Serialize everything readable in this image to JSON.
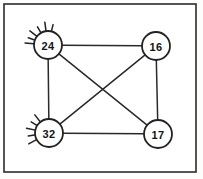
{
  "figure": {
    "background_color": "#fdfdfc",
    "ink_color": "#222222",
    "frame": {
      "name": "border frame",
      "x": 4,
      "y": 4,
      "width": 192,
      "height": 168
    }
  },
  "nodes": [
    {
      "id": "n24",
      "label": "24",
      "cx": 48,
      "cy": 45,
      "r": 14,
      "has_spikes": true,
      "spike_angles": [
        185,
        200,
        218,
        240,
        262,
        284
      ]
    },
    {
      "id": "n16",
      "label": "16",
      "cx": 156,
      "cy": 46,
      "r": 14,
      "has_spikes": false,
      "spike_angles": []
    },
    {
      "id": "n32",
      "label": "32",
      "cx": 49,
      "cy": 133,
      "r": 14,
      "has_spikes": true,
      "spike_angles": [
        152,
        172,
        192,
        212,
        232
      ]
    },
    {
      "id": "n17",
      "label": "17",
      "cx": 158,
      "cy": 134,
      "r": 14,
      "has_spikes": false,
      "spike_angles": []
    }
  ],
  "edges": [
    {
      "id": "e-24-16",
      "from": "n24",
      "to": "n16",
      "name": "edge-24-16"
    },
    {
      "id": "e-24-32",
      "from": "n24",
      "to": "n32",
      "name": "edge-24-32"
    },
    {
      "id": "e-16-17",
      "from": "n16",
      "to": "n17",
      "name": "edge-16-17"
    },
    {
      "id": "e-32-17",
      "from": "n32",
      "to": "n17",
      "name": "edge-32-17"
    },
    {
      "id": "e-24-17",
      "from": "n24",
      "to": "n17",
      "name": "edge-24-17"
    },
    {
      "id": "e-32-16",
      "from": "n32",
      "to": "n16",
      "name": "edge-32-16"
    }
  ],
  "chart_data": {
    "type": "diagram",
    "node_labels": [
      "24",
      "16",
      "32",
      "17"
    ],
    "node_values": [
      24,
      16,
      32,
      17
    ],
    "edge_pairs": [
      [
        "24",
        "16"
      ],
      [
        "24",
        "32"
      ],
      [
        "16",
        "17"
      ],
      [
        "32",
        "17"
      ],
      [
        "24",
        "17"
      ],
      [
        "32",
        "16"
      ]
    ],
    "edge_count": 6,
    "node_count": 4,
    "nodes_with_spikes": [
      "24",
      "32"
    ],
    "legend": [],
    "grid": false
  }
}
